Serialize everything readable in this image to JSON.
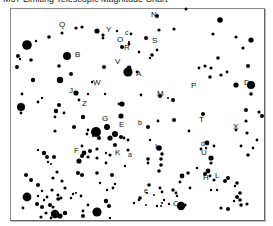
{
  "title": "M67 Limiting Telescopic Magnitude Chart",
  "chart_data": {
    "type": "scatter",
    "title": "M67 Limiting Telescopic Magnitude Chart",
    "xlabel": "",
    "ylabel": "",
    "grid": false,
    "legend": "none",
    "note": "Star field chart; dot size indicates brightness. Coordinates in image pixels.",
    "labels": [
      {
        "text": "N",
        "x": 151,
        "y": 17
      },
      {
        "text": "Q",
        "x": 59,
        "y": 27
      },
      {
        "text": "Y",
        "x": 106,
        "y": 32
      },
      {
        "text": "c",
        "x": 125,
        "y": 35
      },
      {
        "text": "O",
        "x": 117,
        "y": 42
      },
      {
        "text": "R",
        "x": 124,
        "y": 50
      },
      {
        "text": "S",
        "x": 152,
        "y": 43
      },
      {
        "text": "B",
        "x": 75,
        "y": 57
      },
      {
        "text": "V",
        "x": 115,
        "y": 64
      },
      {
        "text": "A",
        "x": 136,
        "y": 76
      },
      {
        "text": "W",
        "x": 93,
        "y": 85
      },
      {
        "text": "J",
        "x": 69,
        "y": 93
      },
      {
        "text": "M",
        "x": 157,
        "y": 96
      },
      {
        "text": "P",
        "x": 191,
        "y": 88
      },
      {
        "text": "D",
        "x": 244,
        "y": 85
      },
      {
        "text": "Z",
        "x": 82,
        "y": 106
      },
      {
        "text": "G",
        "x": 102,
        "y": 121
      },
      {
        "text": "E",
        "x": 119,
        "y": 127
      },
      {
        "text": "b",
        "x": 138,
        "y": 125
      },
      {
        "text": "T",
        "x": 199,
        "y": 122
      },
      {
        "text": "X",
        "x": 233,
        "y": 129
      },
      {
        "text": "F",
        "x": 74,
        "y": 153
      },
      {
        "text": "K",
        "x": 115,
        "y": 155
      },
      {
        "text": "a",
        "x": 128,
        "y": 157
      },
      {
        "text": "I",
        "x": 155,
        "y": 149
      },
      {
        "text": "d",
        "x": 201,
        "y": 146
      },
      {
        "text": "U",
        "x": 201,
        "y": 155
      },
      {
        "text": "H",
        "x": 203,
        "y": 180
      },
      {
        "text": "L",
        "x": 215,
        "y": 178
      },
      {
        "text": "e",
        "x": 144,
        "y": 193
      },
      {
        "text": "C",
        "x": 173,
        "y": 206
      }
    ],
    "stars": [
      [
        157,
        16,
        2.0
      ],
      [
        186,
        9,
        1.5
      ],
      [
        220,
        20,
        2.8
      ],
      [
        213,
        34,
        1.6
      ],
      [
        236,
        37,
        1.6
      ],
      [
        251,
        40,
        2.6
      ],
      [
        243,
        48,
        1.6
      ],
      [
        248,
        66,
        2.0
      ],
      [
        218,
        58,
        1.8
      ],
      [
        205,
        66,
        1.6
      ],
      [
        199,
        68,
        1.4
      ],
      [
        211,
        68,
        1.6
      ],
      [
        210,
        77,
        1.8
      ],
      [
        221,
        75,
        1.6
      ],
      [
        227,
        72,
        1.4
      ],
      [
        236,
        85,
        2.6
      ],
      [
        251,
        85,
        4.0
      ],
      [
        251,
        94,
        1.8
      ],
      [
        246,
        110,
        2.0
      ],
      [
        259,
        112,
        1.6
      ],
      [
        262,
        116,
        2.0
      ],
      [
        203,
        114,
        2.0
      ],
      [
        174,
        120,
        2.0
      ],
      [
        189,
        131,
        1.4
      ],
      [
        236,
        130,
        1.4
      ],
      [
        257,
        140,
        1.4
      ],
      [
        253,
        148,
        1.4
      ],
      [
        248,
        155,
        1.8
      ],
      [
        62,
        33,
        1.5
      ],
      [
        76,
        28,
        1.6
      ],
      [
        82,
        27,
        1.6
      ],
      [
        49,
        37,
        1.8
      ],
      [
        27,
        45,
        4.8
      ],
      [
        36,
        41,
        1.2
      ],
      [
        18,
        56,
        2.0
      ],
      [
        20,
        59,
        1.2
      ],
      [
        31,
        60,
        1.8
      ],
      [
        17,
        67,
        2.0
      ],
      [
        59,
        66,
        1.8
      ],
      [
        67,
        56,
        4.0
      ],
      [
        71,
        74,
        2.0
      ],
      [
        60,
        80,
        3.2
      ],
      [
        33,
        80,
        2.2
      ],
      [
        22,
        94,
        1.4
      ],
      [
        21,
        107,
        4.0
      ],
      [
        21,
        113,
        1.4
      ],
      [
        38,
        102,
        1.4
      ],
      [
        42,
        98,
        1.2
      ],
      [
        76,
        93,
        2.6
      ],
      [
        88,
        94,
        1.2
      ],
      [
        59,
        105,
        2.0
      ],
      [
        56,
        111,
        2.2
      ],
      [
        64,
        113,
        1.4
      ],
      [
        55,
        117,
        1.4
      ],
      [
        83,
        117,
        2.2
      ],
      [
        74,
        127,
        2.0
      ],
      [
        55,
        131,
        1.6
      ],
      [
        88,
        130,
        1.4
      ],
      [
        38,
        150,
        1.2
      ],
      [
        97,
        31,
        2.6
      ],
      [
        103,
        35,
        1.6
      ],
      [
        103,
        38,
        1.4
      ],
      [
        117,
        31,
        1.2
      ],
      [
        131,
        34,
        1.4
      ],
      [
        129,
        44,
        1.4
      ],
      [
        146,
        38,
        2.0
      ],
      [
        159,
        30,
        1.6
      ],
      [
        174,
        29,
        1.6
      ],
      [
        152,
        55,
        1.8
      ],
      [
        139,
        52,
        1.4
      ],
      [
        150,
        58,
        1.2
      ],
      [
        157,
        50,
        1.4
      ],
      [
        122,
        47,
        2.0
      ],
      [
        129,
        42,
        1.0
      ],
      [
        104,
        67,
        2.0
      ],
      [
        128,
        72,
        4.6
      ],
      [
        129,
        68,
        2.4
      ],
      [
        137,
        72,
        1.4
      ],
      [
        92,
        82,
        1.2
      ],
      [
        79,
        100,
        1.4
      ],
      [
        105,
        94,
        1.2
      ],
      [
        122,
        104,
        2.6
      ],
      [
        121,
        116,
        2.6
      ],
      [
        119,
        104,
        1.4
      ],
      [
        141,
        95,
        1.4
      ],
      [
        148,
        127,
        2.0
      ],
      [
        150,
        140,
        1.2
      ],
      [
        158,
        121,
        1.4
      ],
      [
        173,
        100,
        2.0
      ],
      [
        160,
        96,
        2.0
      ],
      [
        168,
        98,
        1.0
      ],
      [
        96,
        132,
        5.0
      ],
      [
        107,
        127,
        3.0
      ],
      [
        99,
        138,
        2.0
      ],
      [
        110,
        138,
        2.6
      ],
      [
        115,
        134,
        3.0
      ],
      [
        121,
        137,
        2.0
      ],
      [
        124,
        138,
        1.4
      ],
      [
        128,
        140,
        1.4
      ],
      [
        82,
        146,
        1.4
      ],
      [
        87,
        134,
        1.4
      ],
      [
        93,
        136,
        1.0
      ],
      [
        115,
        145,
        2.0
      ],
      [
        90,
        151,
        2.0
      ],
      [
        88,
        157,
        1.6
      ],
      [
        84,
        153,
        2.4
      ],
      [
        97,
        149,
        1.6
      ],
      [
        106,
        153,
        1.2
      ],
      [
        110,
        155,
        1.6
      ],
      [
        128,
        150,
        1.6
      ],
      [
        54,
        157,
        2.0
      ],
      [
        44,
        153,
        2.2
      ],
      [
        47,
        157,
        2.0
      ],
      [
        48,
        162,
        1.2
      ],
      [
        51,
        164,
        1.0
      ],
      [
        79,
        161,
        2.6
      ],
      [
        82,
        156,
        2.0
      ],
      [
        97,
        158,
        1.6
      ],
      [
        106,
        163,
        1.4
      ],
      [
        97,
        173,
        1.8
      ],
      [
        78,
        173,
        2.0
      ],
      [
        82,
        175,
        2.0
      ],
      [
        112,
        175,
        2.0
      ],
      [
        100,
        183,
        1.2
      ],
      [
        107,
        190,
        1.2
      ],
      [
        115,
        184,
        1.2
      ],
      [
        113,
        188,
        1.4
      ],
      [
        125,
        166,
        1.2
      ],
      [
        26,
        175,
        2.0
      ],
      [
        31,
        180,
        2.0
      ],
      [
        38,
        185,
        2.0
      ],
      [
        52,
        190,
        1.6
      ],
      [
        53,
        178,
        1.6
      ],
      [
        57,
        172,
        1.6
      ],
      [
        62,
        181,
        1.6
      ],
      [
        65,
        188,
        1.6
      ],
      [
        47,
        197,
        1.4
      ],
      [
        44,
        200,
        1.2
      ],
      [
        27,
        197,
        4.4
      ],
      [
        38,
        196,
        1.2
      ],
      [
        42,
        191,
        1.2
      ],
      [
        58,
        195,
        1.6
      ],
      [
        59,
        199,
        1.4
      ],
      [
        46,
        213,
        1.6
      ],
      [
        37,
        204,
        2.0
      ],
      [
        42,
        207,
        2.0
      ],
      [
        50,
        205,
        2.0
      ],
      [
        53,
        207,
        1.6
      ],
      [
        58,
        199,
        1.8
      ],
      [
        61,
        198,
        1.4
      ],
      [
        71,
        198,
        1.2
      ],
      [
        73,
        194,
        1.2
      ],
      [
        81,
        196,
        1.4
      ],
      [
        76,
        193,
        1.0
      ],
      [
        23,
        208,
        1.4
      ],
      [
        41,
        217,
        1.6
      ],
      [
        55,
        214,
        4.2
      ],
      [
        60,
        216,
        2.6
      ],
      [
        65,
        213,
        2.2
      ],
      [
        51,
        218,
        1.4
      ],
      [
        83,
        211,
        1.4
      ],
      [
        83,
        216,
        2.0
      ],
      [
        109,
        206,
        2.0
      ],
      [
        97,
        212,
        4.6
      ],
      [
        106,
        201,
        2.2
      ],
      [
        110,
        218,
        1.2
      ],
      [
        88,
        205,
        1.4
      ],
      [
        159,
        148,
        2.8
      ],
      [
        162,
        154,
        1.8
      ],
      [
        161,
        159,
        1.8
      ],
      [
        161,
        165,
        1.8
      ],
      [
        159,
        171,
        1.8
      ],
      [
        148,
        159,
        1.8
      ],
      [
        148,
        163,
        1.4
      ],
      [
        182,
        176,
        2.4
      ],
      [
        188,
        173,
        1.8
      ],
      [
        180,
        182,
        1.4
      ],
      [
        190,
        188,
        1.4
      ],
      [
        173,
        190,
        1.8
      ],
      [
        176,
        193,
        1.4
      ],
      [
        185,
        205,
        1.6
      ],
      [
        149,
        185,
        1.8
      ],
      [
        160,
        188,
        1.4
      ],
      [
        162,
        192,
        1.4
      ],
      [
        147,
        193,
        1.0
      ],
      [
        154,
        195,
        1.0
      ],
      [
        140,
        198,
        1.8
      ],
      [
        134,
        203,
        1.2
      ],
      [
        139,
        200,
        1.2
      ],
      [
        164,
        200,
        1.2
      ],
      [
        169,
        204,
        1.2
      ],
      [
        157,
        206,
        1.2
      ],
      [
        162,
        203,
        1.0
      ],
      [
        146,
        205,
        1.0
      ],
      [
        161,
        206,
        1.0
      ],
      [
        208,
        171,
        2.4
      ],
      [
        210,
        176,
        1.4
      ],
      [
        214,
        180,
        1.6
      ],
      [
        225,
        181,
        2.0
      ],
      [
        228,
        178,
        2.0
      ],
      [
        211,
        190,
        1.2
      ],
      [
        217,
        190,
        1.2
      ],
      [
        221,
        208,
        1.6
      ],
      [
        228,
        209,
        2.0
      ],
      [
        237,
        183,
        1.8
      ],
      [
        240,
        193,
        1.8
      ],
      [
        237,
        197,
        2.0
      ],
      [
        240,
        200,
        1.8
      ],
      [
        241,
        205,
        1.8
      ],
      [
        234,
        201,
        1.2
      ],
      [
        235,
        186,
        1.2
      ],
      [
        247,
        204,
        1.6
      ],
      [
        181,
        206,
        4.2
      ],
      [
        177,
        196,
        1.2
      ],
      [
        207,
        143,
        2.4
      ],
      [
        201,
        149,
        1.4
      ],
      [
        206,
        148,
        1.2
      ],
      [
        211,
        158,
        2.6
      ],
      [
        211,
        163,
        1.6
      ],
      [
        205,
        174,
        2.0
      ],
      [
        197,
        168,
        1.2
      ],
      [
        214,
        146,
        1.4
      ],
      [
        246,
        121,
        1.6
      ],
      [
        247,
        133,
        1.6
      ],
      [
        241,
        146,
        1.4
      ]
    ]
  }
}
